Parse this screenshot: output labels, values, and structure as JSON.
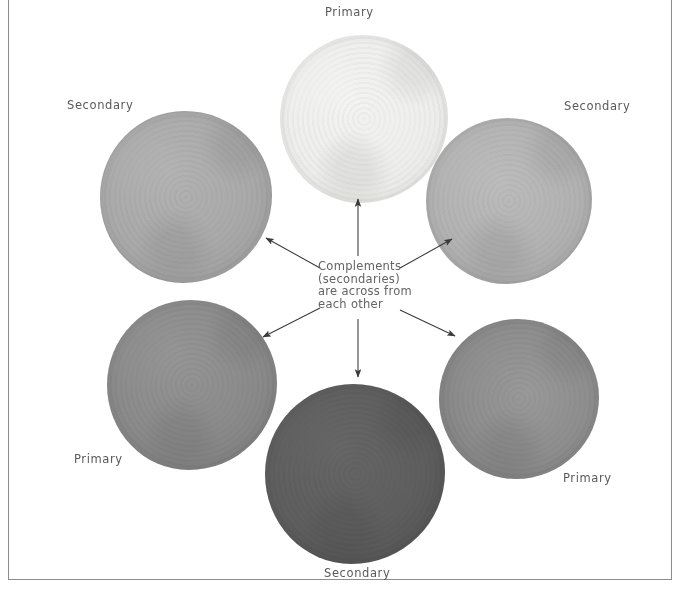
{
  "figure": {
    "kind": "color-wheel-diagram",
    "background": "#ffffff",
    "frame_color": "#8d8d8d"
  },
  "caption": {
    "line1": "Complements",
    "line2": "(secondaries)",
    "line3": "are across from",
    "line4": "each other"
  },
  "labels": {
    "top": "Primary",
    "upper_left": "Secondary",
    "upper_right": "Secondary",
    "lower_left": "Primary",
    "lower_right": "Primary",
    "bottom": "Secondary"
  },
  "swatches": [
    {
      "id": "swatch-top",
      "label": "Primary",
      "position": "top",
      "role": "primary",
      "color": "#eeeeec",
      "edge_color": "#e2e2de",
      "cx": 364,
      "cy": 119,
      "r": 84
    },
    {
      "id": "swatch-upper-left",
      "label": "Secondary",
      "position": "upper-left",
      "role": "secondary",
      "color": "#a9a9a9",
      "edge_color": "#9c9c9c",
      "cx": 186,
      "cy": 197,
      "r": 86
    },
    {
      "id": "swatch-upper-right",
      "label": "Secondary",
      "position": "upper-right",
      "role": "secondary",
      "color": "#b2b2b2",
      "edge_color": "#a3a3a3",
      "cx": 509,
      "cy": 201,
      "r": 83
    },
    {
      "id": "swatch-lower-left",
      "label": "Primary",
      "position": "lower-left",
      "role": "primary",
      "color": "#8a8a8a",
      "edge_color": "#7b7b7b",
      "cx": 192,
      "cy": 385,
      "r": 85
    },
    {
      "id": "swatch-lower-right",
      "label": "Primary",
      "position": "lower-right",
      "role": "primary",
      "color": "#8e8e8e",
      "edge_color": "#7d7d7d",
      "cx": 519,
      "cy": 399,
      "r": 80
    },
    {
      "id": "swatch-bottom",
      "label": "Secondary",
      "position": "bottom",
      "role": "secondary",
      "color": "#5e5e5e",
      "edge_color": "#525252",
      "cx": 355,
      "cy": 474,
      "r": 90
    }
  ],
  "arrows": {
    "count": 6,
    "color": "#3a3a3a",
    "directions": [
      "up",
      "up-left",
      "up-right",
      "down-left",
      "down-right",
      "down"
    ]
  }
}
